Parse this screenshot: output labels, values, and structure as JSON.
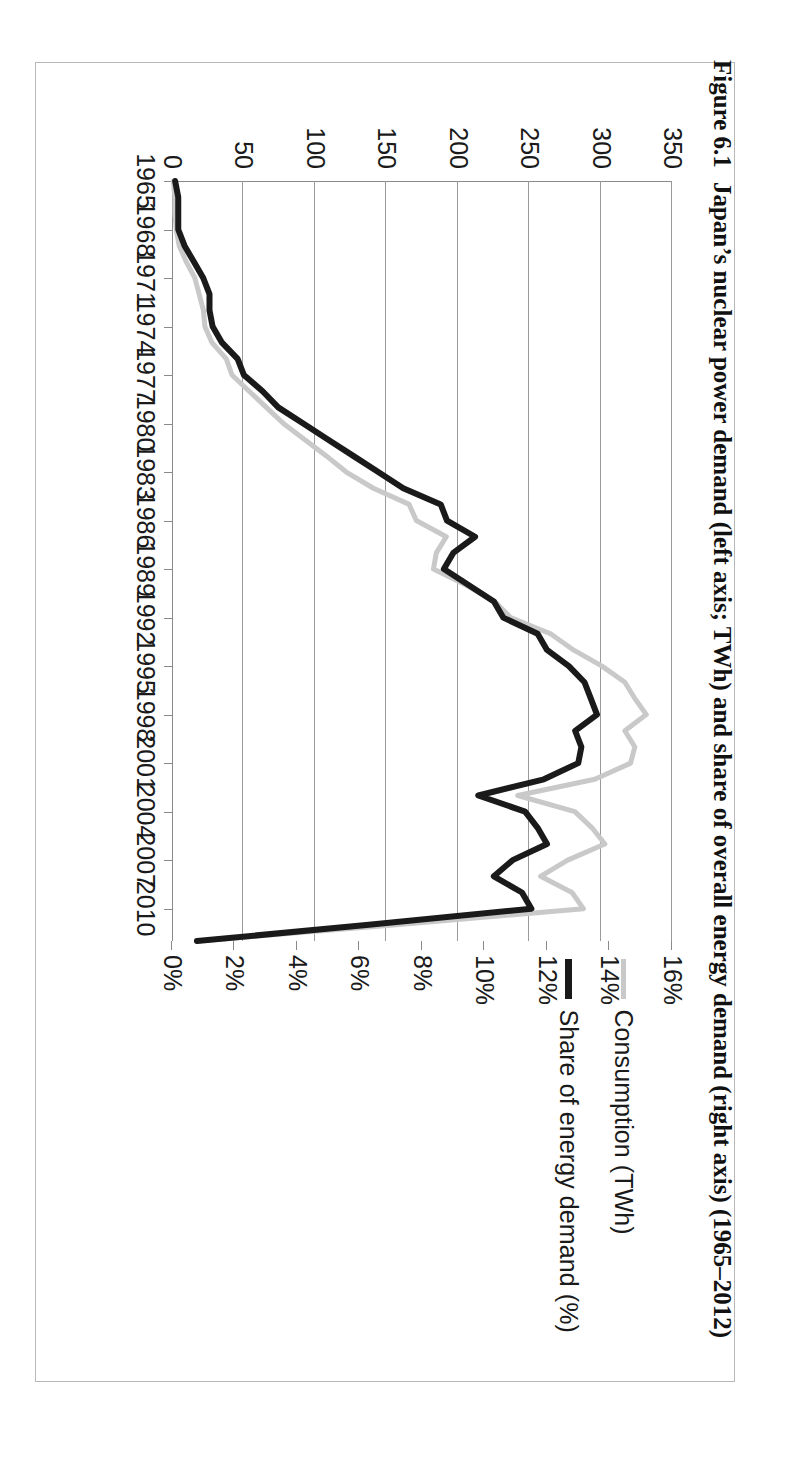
{
  "caption": {
    "number": "Figure 6.1",
    "text": "Japan’s nuclear power demand (left axis; TWh) and share of overall energy demand (right axis) (1965–2012)",
    "full": "Figure 6.1   Japan’s nuclear power demand (left axis; TWh) and share of overall energy demand (right axis) (1965–2012)"
  },
  "legend": {
    "position": "top-right",
    "items": [
      {
        "label": "Consumption (TWh)",
        "color": "#c9c9c9",
        "icon": "line-swatch"
      },
      {
        "label": "Share of energy demand (%)",
        "color": "#1a1a1a",
        "icon": "line-swatch"
      }
    ]
  },
  "axes": {
    "left": {
      "title": "",
      "ticks": [
        "0",
        "50",
        "100",
        "150",
        "200",
        "250",
        "300",
        "350"
      ],
      "min": 0,
      "max": 350,
      "unit": "TWh"
    },
    "right": {
      "title": "",
      "ticks": [
        "0%",
        "2%",
        "4%",
        "6%",
        "8%",
        "10%",
        "12%",
        "14%",
        "16%"
      ],
      "min": 0,
      "max": 16,
      "unit": "%"
    },
    "category": {
      "ticks": [
        "1965",
        "1968",
        "1971",
        "1974",
        "1977",
        "1980",
        "1983",
        "1986",
        "1989",
        "1992",
        "1995",
        "1998",
        "2001",
        "2004",
        "2007",
        "2010"
      ]
    }
  },
  "chart_data": {
    "type": "line",
    "title": "Japan’s nuclear power demand (left axis; TWh) and share of overall energy demand (right axis) (1965–2012)",
    "xlabel": "",
    "ylabel": "Consumption (TWh)",
    "y2label": "Share of energy demand (%)",
    "ylim": [
      0,
      350
    ],
    "y2lim": [
      0,
      16
    ],
    "grid": true,
    "legend_position": "top-right",
    "x": [
      1965,
      1966,
      1967,
      1968,
      1969,
      1970,
      1971,
      1972,
      1973,
      1974,
      1975,
      1976,
      1977,
      1978,
      1979,
      1980,
      1981,
      1982,
      1983,
      1984,
      1985,
      1986,
      1987,
      1988,
      1989,
      1990,
      1991,
      1992,
      1993,
      1994,
      1995,
      1996,
      1997,
      1998,
      1999,
      2000,
      2001,
      2002,
      2003,
      2004,
      2005,
      2006,
      2007,
      2008,
      2009,
      2010,
      2011,
      2012
    ],
    "series": [
      {
        "name": "Consumption (TWh)",
        "color": "#c9c9c9",
        "axis": "left",
        "values": [
          1,
          2,
          2,
          3,
          5,
          10,
          16,
          19,
          22,
          23,
          28,
          38,
          42,
          54,
          66,
          78,
          93,
          108,
          122,
          141,
          166,
          171,
          192,
          185,
          183,
          206,
          226,
          237,
          265,
          281,
          301,
          317,
          324,
          332,
          317,
          324,
          321,
          296,
          242,
          282,
          294,
          303,
          277,
          258,
          280,
          288,
          157,
          17
        ]
      },
      {
        "name": "Share of energy demand (%)",
        "color": "#1a1a1a",
        "axis": "right",
        "values": [
          0.1,
          0.2,
          0.2,
          0.2,
          0.4,
          0.7,
          1.0,
          1.2,
          1.2,
          1.3,
          1.6,
          2.1,
          2.3,
          2.9,
          3.4,
          4.2,
          5.0,
          5.8,
          6.6,
          7.4,
          8.6,
          8.8,
          9.7,
          9.0,
          8.7,
          9.5,
          10.3,
          10.6,
          11.7,
          12.0,
          12.7,
          13.2,
          13.4,
          13.6,
          12.9,
          13.1,
          13.0,
          11.9,
          9.8,
          11.3,
          11.7,
          12.0,
          10.9,
          10.3,
          11.2,
          11.5,
          6.3,
          0.8
        ]
      }
    ]
  }
}
